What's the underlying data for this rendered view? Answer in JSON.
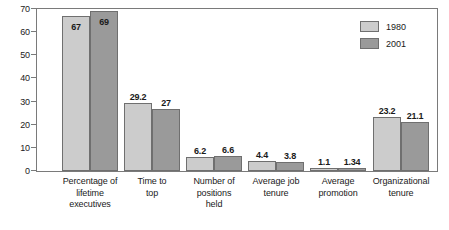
{
  "chart_data": {
    "type": "bar",
    "title": "",
    "subtitle": "",
    "xlabel": "",
    "ylabel": "",
    "ylim": [
      0,
      70
    ],
    "yticks": [
      0,
      10,
      20,
      30,
      40,
      50,
      60,
      70
    ],
    "ytick_labels": [
      "0",
      "10",
      "20",
      "30",
      "40",
      "50",
      "60",
      "70"
    ],
    "grid": false,
    "legend_position": "top-right",
    "categories": [
      "Percentage of lifetime executives",
      "Time to top",
      "Number of positions held",
      "Average job tenure",
      "Average promotion",
      "Organizational tenure"
    ],
    "category_lines": [
      [
        "Percentage of",
        "lifetime",
        "executives"
      ],
      [
        "Time to",
        "top"
      ],
      [
        "Number of",
        "positions",
        "held"
      ],
      [
        "Average job",
        "tenure"
      ],
      [
        "Average",
        "promotion"
      ],
      [
        "Organizational",
        "tenure"
      ]
    ],
    "series": [
      {
        "name": "1980",
        "color": "#cccccc",
        "values": [
          67,
          29.2,
          6.2,
          4.4,
          1.1,
          23.2
        ],
        "labels": [
          "67",
          "29.2",
          "6.2",
          "4.4",
          "1.1",
          "23.2"
        ]
      },
      {
        "name": "2001",
        "color": "#9a9a9a",
        "values": [
          69,
          27,
          6.6,
          3.8,
          1.34,
          21.1
        ],
        "labels": [
          "69",
          "27",
          "6.6",
          "3.8",
          "1.34",
          "21.1"
        ]
      }
    ]
  },
  "legend": {
    "entries": [
      {
        "label": "1980"
      },
      {
        "label": "2001"
      }
    ]
  },
  "colors": {
    "series_1980": "#cccccc",
    "series_2001": "#9a9a9a",
    "axis": "#7a7a7a",
    "bar_outline": "#6f6f6f",
    "text": "#1a1a1a",
    "background": "#ffffff"
  }
}
